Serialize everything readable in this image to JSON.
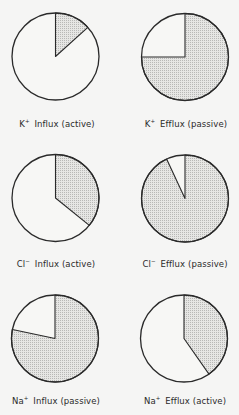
{
  "colors": {
    "background": "#f5f5f4",
    "outline": "#2a2a2a",
    "shade_fill": "#e6e6e4",
    "shade_dot": "#b8b8b6",
    "unshaded_fill": "#f7f7f5"
  },
  "chart_data": [
    {
      "type": "pie",
      "title": "K+ Influx (active)",
      "ion": "K",
      "charge": "+",
      "direction": "Influx",
      "mode": "active",
      "slices": [
        {
          "name": "shaded",
          "value": 13
        },
        {
          "name": "unshaded",
          "value": 87
        }
      ],
      "shaded_start_deg": 0,
      "shaded_end_deg": 48
    },
    {
      "type": "pie",
      "title": "K+ Efflux (passive)",
      "ion": "K",
      "charge": "+",
      "direction": "Efflux",
      "mode": "passive",
      "slices": [
        {
          "name": "shaded",
          "value": 75
        },
        {
          "name": "unshaded",
          "value": 25
        }
      ],
      "shaded_start_deg": 0,
      "shaded_end_deg": 270
    },
    {
      "type": "pie",
      "title": "Cl- Influx (active)",
      "ion": "Cl",
      "charge": "−",
      "direction": "Influx",
      "mode": "active",
      "slices": [
        {
          "name": "shaded",
          "value": 36
        },
        {
          "name": "unshaded",
          "value": 64
        }
      ],
      "shaded_start_deg": 0,
      "shaded_end_deg": 129
    },
    {
      "type": "pie",
      "title": "Cl- Efflux (passive)",
      "ion": "Cl",
      "charge": "−",
      "direction": "Efflux",
      "mode": "passive",
      "slices": [
        {
          "name": "shaded",
          "value": 93
        },
        {
          "name": "unshaded",
          "value": 7
        }
      ],
      "shaded_start_deg": 0,
      "shaded_end_deg": 335
    },
    {
      "type": "pie",
      "title": "Na+ Influx (passive)",
      "ion": "Na",
      "charge": "+",
      "direction": "Influx",
      "mode": "passive",
      "slices": [
        {
          "name": "shaded",
          "value": 78
        },
        {
          "name": "unshaded",
          "value": 22
        }
      ],
      "shaded_start_deg": 0,
      "shaded_end_deg": 282
    },
    {
      "type": "pie",
      "title": "Na+ Efflux (active)",
      "ion": "Na",
      "charge": "+",
      "direction": "Efflux",
      "mode": "active",
      "slices": [
        {
          "name": "shaded",
          "value": 40
        },
        {
          "name": "unshaded",
          "value": 60
        }
      ],
      "shaded_start_deg": 0,
      "shaded_end_deg": 145
    }
  ],
  "layout": {
    "radius": 43.5,
    "centers": [
      [
        55.5,
        56.5
      ],
      [
        185,
        57
      ],
      [
        55.5,
        198
      ],
      [
        185,
        198.5
      ],
      [
        55,
        338.5
      ],
      [
        184,
        338.5
      ]
    ],
    "label_y": [
      118,
      258,
      395
    ]
  },
  "labels": [
    {
      "ion": "K",
      "charge": "+",
      "text": "Influx (active)"
    },
    {
      "ion": "K",
      "charge": "+",
      "text": "Efflux (passive)"
    },
    {
      "ion": "Cl",
      "charge": "−",
      "text": "Influx (active)"
    },
    {
      "ion": "Cl",
      "charge": "−",
      "text": "Efflux (passive)"
    },
    {
      "ion": "Na",
      "charge": "+",
      "text": "Influx (passive)"
    },
    {
      "ion": "Na",
      "charge": "+",
      "text": "Efflux (active)"
    }
  ]
}
